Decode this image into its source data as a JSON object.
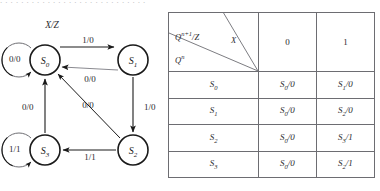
{
  "page": {
    "top_partial_text": ". . . . . . . . . . . . . . . . . . . . . . . . . . . .",
    "ink_color": "#1a1a1a",
    "rule_color": "#6d6d72"
  },
  "diagram": {
    "title_label": "X/Z",
    "states": [
      {
        "id": "S0",
        "label": "S",
        "sub": "0",
        "cx": 45,
        "cy": 50
      },
      {
        "id": "S1",
        "label": "S",
        "sub": "1",
        "cx": 133,
        "cy": 50
      },
      {
        "id": "S2",
        "label": "S",
        "sub": "2",
        "cx": 133,
        "cy": 140
      },
      {
        "id": "S3",
        "label": "S",
        "sub": "3",
        "cx": 45,
        "cy": 140
      }
    ],
    "self_loops": [
      {
        "state": "S0",
        "label": "0/0"
      },
      {
        "state": "S3",
        "label": "1/1"
      }
    ],
    "transitions": [
      {
        "from": "S0",
        "to": "S1",
        "label": "1/0"
      },
      {
        "from": "S1",
        "to": "S0",
        "label": "0/0"
      },
      {
        "from": "S1",
        "to": "S2",
        "label": "1/0"
      },
      {
        "from": "S2",
        "to": "S0",
        "label": "0/0"
      },
      {
        "from": "S2",
        "to": "S3",
        "label": "1/1"
      },
      {
        "from": "S3",
        "to": "S0",
        "label": "0/0"
      }
    ]
  },
  "table": {
    "header": {
      "next_state_output": "Q",
      "next_state_output_sup": "n+1",
      "next_state_output_tail": "/Z",
      "input_symbol": "X",
      "current_state": "Q",
      "current_state_sup": "n",
      "columns": [
        "0",
        "1"
      ]
    },
    "rows": [
      {
        "state": "S",
        "state_sub": "0",
        "on0": "S",
        "on0_sub": "0",
        "on0_out": "/0",
        "on1": "S",
        "on1_sub": "1",
        "on1_out": "/0"
      },
      {
        "state": "S",
        "state_sub": "1",
        "on0": "S",
        "on0_sub": "0",
        "on0_out": "/0",
        "on1": "S",
        "on1_sub": "2",
        "on1_out": "/0"
      },
      {
        "state": "S",
        "state_sub": "2",
        "on0": "S",
        "on0_sub": "0",
        "on0_out": "/0",
        "on1": "S",
        "on1_sub": "3",
        "on1_out": "/1"
      },
      {
        "state": "S",
        "state_sub": "3",
        "on0": "S",
        "on0_sub": "0",
        "on0_out": "/0",
        "on1": "S",
        "on1_sub": "2",
        "on1_out": "/1"
      }
    ]
  }
}
